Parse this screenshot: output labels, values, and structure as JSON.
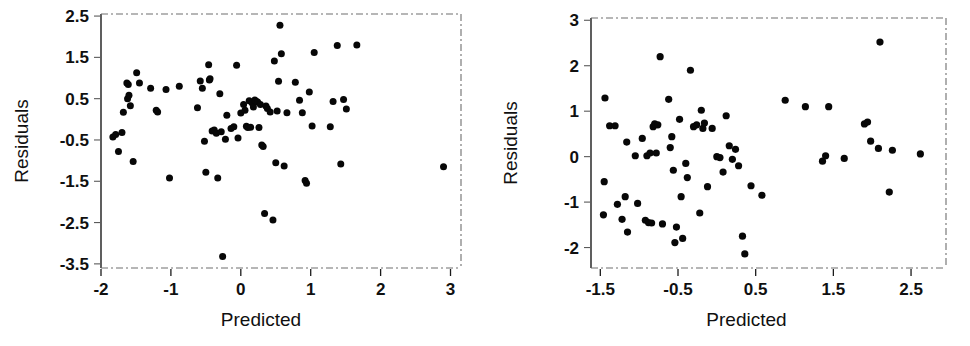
{
  "figure": {
    "background_color": "#ffffff",
    "point_color": "#070707",
    "axis_color": "#1a1a1a"
  },
  "chart_data": [
    {
      "type": "scatter",
      "title": "",
      "xlabel": "Predicted",
      "ylabel": "Residuals",
      "xlim": [
        -2.0,
        3.15
      ],
      "ylim": [
        -3.6,
        2.55
      ],
      "xticks": [
        -2,
        -1,
        0,
        1,
        2,
        3
      ],
      "xticklabels": [
        "-2",
        "-1",
        "0",
        "1",
        "2",
        "3"
      ],
      "yticks": [
        2.5,
        1.5,
        0.5,
        -0.5,
        -1.5,
        -2.5,
        -3.5
      ],
      "yticklabels": [
        "2.5",
        "1.5",
        "0.5",
        "-0.5",
        "-1.5",
        "-2.5",
        "-3.5"
      ],
      "grid": false,
      "legend": "none",
      "points": [
        [
          -1.83,
          -0.43
        ],
        [
          -1.79,
          -0.37
        ],
        [
          -1.75,
          -0.78
        ],
        [
          -1.7,
          -0.32
        ],
        [
          -1.68,
          0.17
        ],
        [
          -1.63,
          0.88
        ],
        [
          -1.62,
          0.5
        ],
        [
          -1.61,
          0.84
        ],
        [
          -1.6,
          0.58
        ],
        [
          -1.58,
          0.33
        ],
        [
          -1.54,
          -1.02
        ],
        [
          -1.49,
          1.13
        ],
        [
          -1.45,
          0.88
        ],
        [
          -1.29,
          0.75
        ],
        [
          -1.21,
          0.22
        ],
        [
          -1.19,
          0.18
        ],
        [
          -1.07,
          0.72
        ],
        [
          -1.02,
          -1.42
        ],
        [
          -0.88,
          0.8
        ],
        [
          -0.62,
          0.28
        ],
        [
          -0.58,
          0.93
        ],
        [
          -0.55,
          0.75
        ],
        [
          -0.52,
          -0.53
        ],
        [
          -0.5,
          -1.28
        ],
        [
          -0.46,
          1.32
        ],
        [
          -0.45,
          0.95
        ],
        [
          -0.44,
          0.98
        ],
        [
          -0.41,
          -0.28
        ],
        [
          -0.38,
          -0.26
        ],
        [
          -0.35,
          -0.34
        ],
        [
          -0.33,
          -1.42
        ],
        [
          -0.3,
          0.62
        ],
        [
          -0.28,
          -0.3
        ],
        [
          -0.26,
          -3.32
        ],
        [
          -0.22,
          -0.48
        ],
        [
          -0.2,
          0.1
        ],
        [
          -0.14,
          -0.22
        ],
        [
          -0.1,
          -0.18
        ],
        [
          -0.06,
          1.31
        ],
        [
          -0.04,
          -0.45
        ],
        [
          0.0,
          0.15
        ],
        [
          0.04,
          0.36
        ],
        [
          0.06,
          0.22
        ],
        [
          0.08,
          -0.17
        ],
        [
          0.1,
          -0.2
        ],
        [
          0.12,
          0.45
        ],
        [
          0.14,
          -0.19
        ],
        [
          0.16,
          0.4
        ],
        [
          0.18,
          0.3
        ],
        [
          0.2,
          0.47
        ],
        [
          0.22,
          0.44
        ],
        [
          0.24,
          0.42
        ],
        [
          0.26,
          -0.2
        ],
        [
          0.28,
          0.36
        ],
        [
          0.3,
          -0.62
        ],
        [
          0.32,
          -0.66
        ],
        [
          0.34,
          -2.28
        ],
        [
          0.36,
          0.32
        ],
        [
          0.38,
          0.26
        ],
        [
          0.42,
          0.18
        ],
        [
          0.46,
          -2.44
        ],
        [
          0.48,
          1.41
        ],
        [
          0.5,
          -1.05
        ],
        [
          0.52,
          0.2
        ],
        [
          0.54,
          0.92
        ],
        [
          0.56,
          2.28
        ],
        [
          0.58,
          1.59
        ],
        [
          0.62,
          -1.13
        ],
        [
          0.66,
          0.16
        ],
        [
          0.78,
          0.9
        ],
        [
          0.84,
          0.46
        ],
        [
          0.88,
          0.16
        ],
        [
          0.92,
          -1.48
        ],
        [
          0.94,
          -1.55
        ],
        [
          0.98,
          0.66
        ],
        [
          1.02,
          -0.16
        ],
        [
          1.05,
          1.62
        ],
        [
          1.28,
          -0.18
        ],
        [
          1.32,
          0.43
        ],
        [
          1.38,
          1.79
        ],
        [
          1.43,
          -1.08
        ],
        [
          1.47,
          0.48
        ],
        [
          1.51,
          0.25
        ],
        [
          1.66,
          1.8
        ],
        [
          2.9,
          -1.15
        ]
      ]
    },
    {
      "type": "scatter",
      "title": "",
      "xlabel": "Predicted",
      "ylabel": "Residuals",
      "xlim": [
        -1.62,
        2.95
      ],
      "ylim": [
        -2.45,
        3.05
      ],
      "xticks": [
        -1.5,
        -0.5,
        0.5,
        1.5,
        2.5
      ],
      "xticklabels": [
        "-1.5",
        "-0.5",
        "0.5",
        "1.5",
        "2.5"
      ],
      "yticks": [
        3,
        2,
        1,
        0,
        -1,
        -2
      ],
      "yticklabels": [
        "3",
        "2",
        "1",
        "0",
        "-1",
        "-2"
      ],
      "grid": false,
      "legend": "none",
      "points": [
        [
          -1.46,
          -1.28
        ],
        [
          -1.45,
          -0.55
        ],
        [
          -1.44,
          1.29
        ],
        [
          -1.38,
          0.68
        ],
        [
          -1.31,
          0.68
        ],
        [
          -1.28,
          -1.05
        ],
        [
          -1.22,
          -1.38
        ],
        [
          -1.18,
          -0.88
        ],
        [
          -1.16,
          0.32
        ],
        [
          -1.15,
          -1.66
        ],
        [
          -1.05,
          0.02
        ],
        [
          -1.02,
          -1.03
        ],
        [
          -0.96,
          0.4
        ],
        [
          -0.92,
          -1.4
        ],
        [
          -0.9,
          0.02
        ],
        [
          -0.88,
          -1.45
        ],
        [
          -0.86,
          0.08
        ],
        [
          -0.84,
          -1.46
        ],
        [
          -0.82,
          0.66
        ],
        [
          -0.8,
          0.72
        ],
        [
          -0.78,
          0.08
        ],
        [
          -0.76,
          0.7
        ],
        [
          -0.73,
          2.2
        ],
        [
          -0.7,
          -1.48
        ],
        [
          -0.62,
          1.26
        ],
        [
          -0.6,
          0.2
        ],
        [
          -0.58,
          0.44
        ],
        [
          -0.56,
          -0.3
        ],
        [
          -0.54,
          -1.89
        ],
        [
          -0.52,
          -1.55
        ],
        [
          -0.48,
          0.82
        ],
        [
          -0.46,
          -0.88
        ],
        [
          -0.44,
          -1.8
        ],
        [
          -0.4,
          -0.15
        ],
        [
          -0.38,
          -0.46
        ],
        [
          -0.34,
          1.9
        ],
        [
          -0.3,
          0.66
        ],
        [
          -0.26,
          0.7
        ],
        [
          -0.22,
          -1.24
        ],
        [
          -0.2,
          1.02
        ],
        [
          -0.18,
          0.62
        ],
        [
          -0.16,
          0.74
        ],
        [
          -0.12,
          -0.66
        ],
        [
          -0.06,
          0.62
        ],
        [
          0.0,
          0.0
        ],
        [
          0.04,
          -0.02
        ],
        [
          0.08,
          -0.34
        ],
        [
          0.12,
          0.9
        ],
        [
          0.16,
          0.24
        ],
        [
          0.2,
          -0.06
        ],
        [
          0.24,
          0.16
        ],
        [
          0.28,
          -0.2
        ],
        [
          0.33,
          -1.75
        ],
        [
          0.36,
          -2.14
        ],
        [
          0.44,
          -0.64
        ],
        [
          0.58,
          -0.85
        ],
        [
          0.88,
          1.24
        ],
        [
          1.14,
          1.1
        ],
        [
          1.36,
          -0.1
        ],
        [
          1.4,
          0.02
        ],
        [
          1.44,
          1.1
        ],
        [
          1.64,
          -0.04
        ],
        [
          1.9,
          0.72
        ],
        [
          1.94,
          0.76
        ],
        [
          1.98,
          0.34
        ],
        [
          2.08,
          0.18
        ],
        [
          2.1,
          2.52
        ],
        [
          2.22,
          -0.78
        ],
        [
          2.26,
          0.14
        ],
        [
          2.62,
          0.06
        ]
      ]
    }
  ]
}
